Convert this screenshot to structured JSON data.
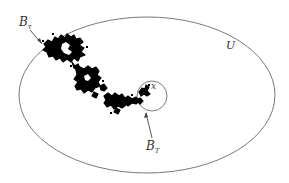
{
  "diagram": {
    "colors": {
      "outline": "#7a7a7a",
      "path": "#000000",
      "text": "#333333",
      "background": "#ffffff"
    },
    "domain_U": {
      "label": "U",
      "shape": "ellipse",
      "cx": 147,
      "cy": 95,
      "rx": 128,
      "ry": 78
    },
    "ball": {
      "label": "x",
      "shape": "circle",
      "cx": 152,
      "cy": 96,
      "r": 15
    },
    "labels": {
      "exit_point": {
        "main": "B",
        "sub": "τ",
        "description": "exit point from U"
      },
      "ball_exit": {
        "main": "B",
        "sub": "T",
        "description": "exit point from ball around x"
      },
      "region": "U",
      "start": "x"
    }
  }
}
